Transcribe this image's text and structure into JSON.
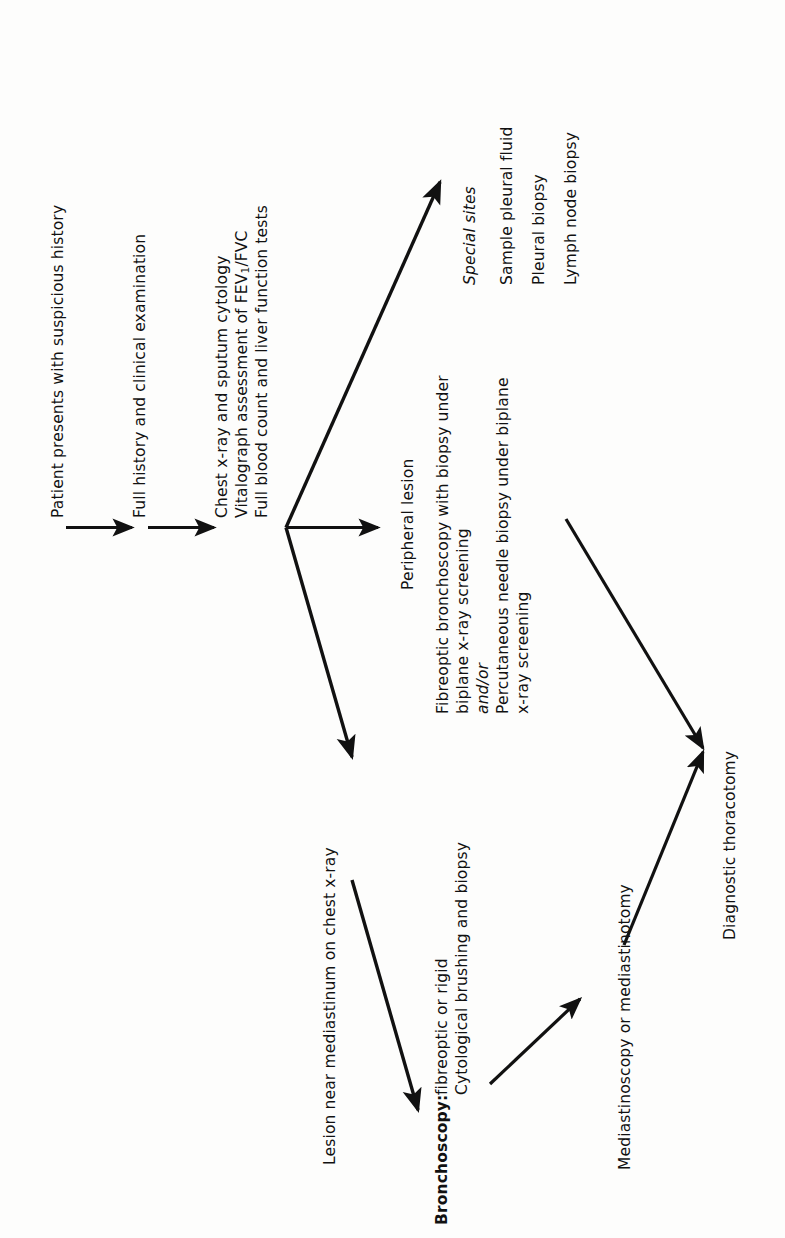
{
  "diagram": {
    "orientation": "rotated-90-ccw",
    "ink_color": "#111111",
    "background_color": "#fdfdfc",
    "nodes": {
      "start": "Patient presents with suspicious history",
      "history": "Full history and clinical examination",
      "investigations_line1": "Chest x-ray and sputum cytology",
      "investigations_line2a": "Vitalograph assessment of FEV",
      "investigations_line2b": "1",
      "investigations_line2c": "/FVC",
      "investigations_line3": "Full blood count and liver function tests",
      "special_sites_heading": "Special sites",
      "special_sites_item1": "Sample pleural fluid",
      "special_sites_item2": "Pleural biopsy",
      "special_sites_item3": "Lymph node biopsy",
      "peripheral_lesion": "Peripheral lesion",
      "peripheral_detail_line1": "Fibreoptic bronchoscopy with biopsy under",
      "peripheral_detail_line2": "biplane x-ray screening",
      "peripheral_detail_line3": "and/or",
      "peripheral_detail_line4": "Percutaneous needle biopsy under biplane",
      "peripheral_detail_line5": "x-ray screening",
      "mediastinum_lesion": "Lesion near mediastinum on chest x-ray",
      "bronchoscopy_label": "Bronchoscopy:",
      "bronchoscopy_line1": "fibreoptic or rigid",
      "bronchoscopy_line2": "Cytological brushing and biopsy",
      "mediastinoscopy": "Mediastinoscopy or mediastinotomy",
      "thoracotomy": "Diagnostic thoracotomy"
    },
    "edges": [
      {
        "name": "start-to-history",
        "from": "start",
        "to": "history",
        "style": "straight-arrow"
      },
      {
        "name": "history-to-investigations",
        "from": "history",
        "to": "investigations",
        "style": "straight-arrow"
      },
      {
        "name": "investigations-to-special-sites",
        "from": "investigations",
        "to": "special_sites",
        "style": "diagonal-arrow-up"
      },
      {
        "name": "investigations-to-peripheral-lesion",
        "from": "investigations",
        "to": "peripheral_lesion",
        "style": "straight-arrow"
      },
      {
        "name": "investigations-to-mediastinum-lesion",
        "from": "investigations",
        "to": "mediastinum_lesion",
        "style": "diagonal-arrow-down"
      },
      {
        "name": "peripheral-to-thoracotomy",
        "from": "peripheral_lesion",
        "to": "thoracotomy",
        "style": "diagonal-arrow-down"
      },
      {
        "name": "bronchoscopy-to-mediastinoscopy",
        "from": "bronchoscopy",
        "to": "mediastinoscopy",
        "style": "diagonal-arrow-up"
      },
      {
        "name": "mediastinoscopy-to-thoracotomy",
        "from": "mediastinoscopy",
        "to": "thoracotomy",
        "style": "diagonal-arrow-up"
      }
    ]
  }
}
